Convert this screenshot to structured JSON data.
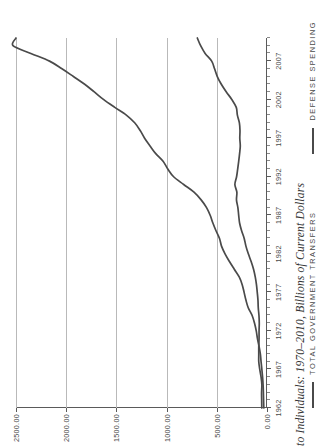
{
  "figure": {
    "title": "to Individuals: 1970–2010, Billions of Current Dollars"
  },
  "legend": {
    "items": [
      {
        "label": "TOTAL GOVERNMENT TRANSFERS",
        "color": "#4a4a4a",
        "swatch": "line-swatch-icon"
      },
      {
        "label": "DEFENSE SPENDING",
        "color": "#4a4a4a",
        "swatch": "line-swatch-icon"
      }
    ]
  },
  "axes": {
    "y_ticklabels": [
      "2500.00",
      "2000.00",
      "1500.00",
      "1000.00",
      "500.00",
      "0.00"
    ],
    "x_ticklabels": [
      "1962",
      "1967",
      "1972",
      "1977",
      "1982",
      "1987",
      "1992",
      "1997",
      "2002",
      "2007"
    ]
  },
  "chart_data": {
    "type": "line",
    "title": "to Individuals: 1970–2010, Billions of Current Dollars",
    "xlabel": "",
    "ylabel": "Billions of Current Dollars",
    "xlim": [
      1962,
      2010
    ],
    "ylim": [
      0,
      2500
    ],
    "yticks": [
      0,
      500,
      1000,
      1500,
      2000,
      2500
    ],
    "ytick_labels": [
      "0.00",
      "500.00",
      "1000.00",
      "1500.00",
      "2000.00",
      "2500.00"
    ],
    "xticks": [
      1962,
      1967,
      1972,
      1977,
      1982,
      1987,
      1992,
      1997,
      2002,
      2007
    ],
    "grid": true,
    "grid_axis": "y",
    "legend_position": "below",
    "orientation": "rotated-90-ccw",
    "x": [
      1962,
      1963,
      1964,
      1965,
      1966,
      1967,
      1968,
      1969,
      1970,
      1971,
      1972,
      1973,
      1974,
      1975,
      1976,
      1977,
      1978,
      1979,
      1980,
      1981,
      1982,
      1983,
      1984,
      1985,
      1986,
      1987,
      1988,
      1989,
      1990,
      1991,
      1992,
      1993,
      1994,
      1995,
      1996,
      1997,
      1998,
      1999,
      2000,
      2001,
      2002,
      2003,
      2004,
      2005,
      2006,
      2007,
      2008,
      2009,
      2010
    ],
    "series": [
      {
        "name": "TOTAL GOVERNMENT TRANSFERS",
        "color": "#4a4a4a",
        "values": [
          32,
          34,
          36,
          39,
          44,
          51,
          59,
          66,
          79,
          95,
          107,
          124,
          148,
          187,
          210,
          228,
          247,
          277,
          326,
          374,
          418,
          453,
          473,
          508,
          539,
          566,
          602,
          656,
          727,
          830,
          930,
          988,
          1035,
          1108,
          1165,
          1219,
          1263,
          1318,
          1401,
          1516,
          1626,
          1720,
          1816,
          1928,
          2042,
          2166,
          2352,
          2530,
          2500
        ]
      },
      {
        "name": "DEFENSE SPENDING",
        "color": "#4a4a4a",
        "values": [
          52,
          53,
          54,
          51,
          59,
          72,
          82,
          82,
          82,
          79,
          79,
          77,
          80,
          87,
          90,
          97,
          105,
          117,
          134,
          158,
          186,
          210,
          227,
          253,
          273,
          282,
          290,
          304,
          300,
          320,
          303,
          292,
          282,
          273,
          266,
          271,
          269,
          275,
          295,
          306,
          349,
          405,
          455,
          495,
          522,
          551,
          616,
          661,
          694
        ]
      }
    ]
  }
}
